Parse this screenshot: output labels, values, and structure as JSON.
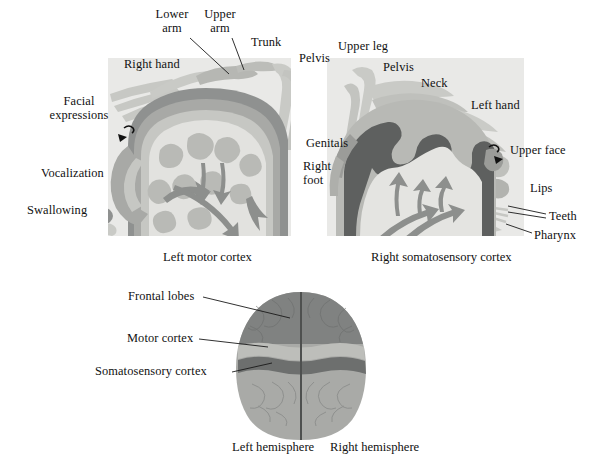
{
  "figure": {
    "title_visible": false,
    "background": "#ffffff",
    "palette": {
      "panel_bg": "#e8e8e6",
      "body_light": "#c9cac6",
      "body_mid": "#b3b4b0",
      "cortex_dark": "#8f9190",
      "cortex_darkest": "#6f7270",
      "cortex_mid": "#a9aaa7",
      "cortex_light": "#dcdcd9",
      "cortex_pale": "#efefec",
      "arrow": "#8d8f8d",
      "right_dark": "#5e605f",
      "brain_frontal": "#808281",
      "brain_motor": "#b9bab7",
      "brain_somato": "#6d6f6e",
      "brain_post": "#a9aaa7",
      "leader_line": "#1a1a1a"
    }
  },
  "panels": [
    {
      "id": "left-motor",
      "caption": "Left motor cortex",
      "labels": [
        {
          "name": "lower-arm",
          "text": "Lower\narm",
          "x": 172,
          "y": 10,
          "align": "center"
        },
        {
          "name": "upper-arm",
          "text": "Upper\narm",
          "x": 218,
          "y": 10,
          "align": "center"
        },
        {
          "name": "trunk",
          "text": "Trunk",
          "x": 253,
          "y": 38,
          "align": "left"
        },
        {
          "name": "right-hand",
          "text": "Right hand",
          "x": 124,
          "y": 60,
          "align": "left"
        },
        {
          "name": "facial-expressions",
          "text": "Facial\nexpressions",
          "x": 78,
          "y": 97,
          "align": "center"
        },
        {
          "name": "vocalization",
          "text": "Vocalization",
          "x": 42,
          "y": 168,
          "align": "left"
        },
        {
          "name": "swallowing",
          "text": "Swallowing",
          "x": 28,
          "y": 205,
          "align": "left"
        },
        {
          "name": "pelvis-left",
          "text": "Pelvis",
          "x": 299,
          "y": 53,
          "align": "left"
        },
        {
          "name": "right-foot",
          "text": "Right\nfoot",
          "x": 300,
          "y": 161,
          "align": "left"
        },
        {
          "name": "genitals",
          "text": "Genitals",
          "x": 306,
          "y": 138,
          "align": "left"
        }
      ]
    },
    {
      "id": "right-somatosensory",
      "caption": "Right somatosensory cortex",
      "labels": [
        {
          "name": "upper-leg",
          "text": "Upper leg",
          "x": 339,
          "y": 42,
          "align": "left"
        },
        {
          "name": "pelvis-right",
          "text": "Pelvis",
          "x": 383,
          "y": 62,
          "align": "left"
        },
        {
          "name": "neck",
          "text": "Neck",
          "x": 422,
          "y": 78,
          "align": "left"
        },
        {
          "name": "left-hand",
          "text": "Left hand",
          "x": 472,
          "y": 100,
          "align": "left"
        },
        {
          "name": "upper-face",
          "text": "Upper face",
          "x": 510,
          "y": 146,
          "align": "left"
        },
        {
          "name": "lips",
          "text": "Lips",
          "x": 528,
          "y": 184,
          "align": "left"
        },
        {
          "name": "teeth",
          "text": "Teeth",
          "x": 548,
          "y": 212,
          "align": "left"
        },
        {
          "name": "pharynx",
          "text": "Pharynx",
          "x": 534,
          "y": 231,
          "align": "left"
        }
      ]
    },
    {
      "id": "brain-top-view",
      "labels": [
        {
          "name": "frontal-lobes",
          "text": "Frontal lobes",
          "x": 129,
          "y": 292,
          "align": "left"
        },
        {
          "name": "motor-cortex",
          "text": "Motor cortex",
          "x": 128,
          "y": 334,
          "align": "left"
        },
        {
          "name": "somatosensory-cortex",
          "text": "Somatosensory cortex",
          "x": 96,
          "y": 367,
          "align": "left"
        }
      ],
      "captions": [
        {
          "name": "left-hemisphere",
          "text": "Left hemisphere",
          "x": 233,
          "y": 441
        },
        {
          "name": "right-hemisphere",
          "text": "Right hemisphere",
          "x": 330,
          "y": 441
        }
      ]
    }
  ],
  "captions": [
    {
      "name": "caption-left-motor",
      "text": "Left motor cortex",
      "x": 164,
      "y": 250
    },
    {
      "name": "caption-right-somato",
      "text": "Right somatosensory cortex",
      "x": 372,
      "y": 250
    }
  ]
}
